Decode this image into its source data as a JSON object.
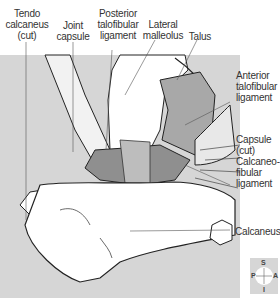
{
  "diagram": {
    "type": "anatomical-illustration",
    "colors": {
      "background_shade": "#d6d6d6",
      "ligament_shade": "#9a9a9a",
      "bone_fill": "#ffffff",
      "outline": "#222222",
      "leader_line": "#555555"
    }
  },
  "labels": {
    "tendo_calcaneus": "Tendo\ncalcaneus\n(cut)",
    "joint_capsule": "Joint\ncapsule",
    "posterior_talofibular": "Posterior\ntalofibular\nligament",
    "lateral_malleolus": "Lateral\nmalleolus",
    "talus": "Talus",
    "anterior_talofibular": "Anterior\ntalofibular\nligament",
    "capsule_cut": "Capsule\n(cut)",
    "calcaneofibular": "Calcaneo-\nfibular\nligament",
    "calcaneus": "Calcaneus"
  },
  "compass": {
    "top": "S",
    "left": "P",
    "right": "A",
    "bottom": "I"
  }
}
